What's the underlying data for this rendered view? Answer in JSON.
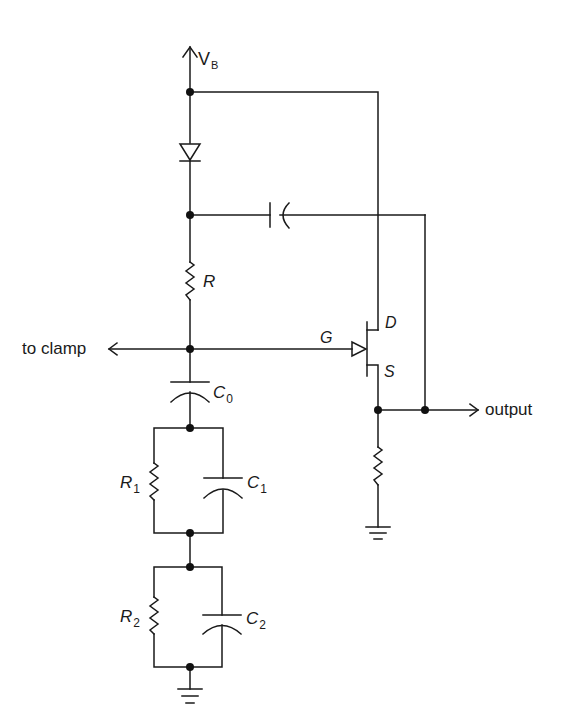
{
  "diagram": {
    "type": "circuit-schematic",
    "labels": {
      "supply": {
        "main": "V",
        "sub": "B"
      },
      "resistor_r": "R",
      "gate": "G",
      "drain": "D",
      "source": "S",
      "to_clamp": "to clamp",
      "output": "output",
      "c0": {
        "main": "C",
        "sub": "0"
      },
      "r1": {
        "main": "R",
        "sub": "1"
      },
      "c1": {
        "main": "C",
        "sub": "1"
      },
      "r2": {
        "main": "R",
        "sub": "2"
      },
      "c2": {
        "main": "C",
        "sub": "2"
      }
    },
    "components": [
      {
        "id": "VB",
        "kind": "supply-arrow"
      },
      {
        "id": "D1",
        "kind": "diode",
        "orientation": "anode-up"
      },
      {
        "id": "Cboot",
        "kind": "capacitor",
        "orientation": "horizontal"
      },
      {
        "id": "R",
        "kind": "resistor"
      },
      {
        "id": "Q1",
        "kind": "n-channel-jfet",
        "pins": [
          "G",
          "D",
          "S"
        ]
      },
      {
        "id": "C0",
        "kind": "capacitor"
      },
      {
        "id": "R1",
        "kind": "resistor"
      },
      {
        "id": "C1",
        "kind": "capacitor"
      },
      {
        "id": "R2",
        "kind": "resistor"
      },
      {
        "id": "C2",
        "kind": "capacitor"
      },
      {
        "id": "RS",
        "kind": "resistor",
        "note": "source load"
      },
      {
        "id": "GND1",
        "kind": "ground"
      },
      {
        "id": "GND2",
        "kind": "ground"
      }
    ],
    "colors": {
      "ink": "#1a1a1a",
      "background": "#ffffff"
    }
  }
}
